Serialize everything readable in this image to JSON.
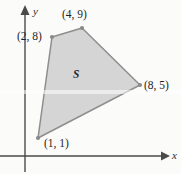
{
  "figure": {
    "background_color": "#fbfbfa",
    "axes": {
      "x_axis_label": "x",
      "y_axis_label": "y",
      "axis_color": "#4a4a4a",
      "x_axis_y_pixel": 156,
      "y_axis_x_pixel": 25
    },
    "region": {
      "label": "S",
      "fill_color": "#d5d5d5",
      "stroke_color": "#8e8e8e",
      "vertex_dot_color": "#8a8a8a",
      "polygon_pixel_points": "52,37 82,28 140,85 38,138"
    },
    "vertex_labels": [
      {
        "key": "v_2_8",
        "text": "(2, 8)"
      },
      {
        "key": "v_4_9",
        "text": "(4, 9)"
      },
      {
        "key": "v_8_5",
        "text": "(8, 5)"
      },
      {
        "key": "v_1_1",
        "text": "(1, 1)"
      }
    ]
  },
  "chart_data": {
    "type": "scatter",
    "title": "",
    "xlabel": "x",
    "ylabel": "y",
    "grid": false,
    "legend": "none",
    "xlim": [
      0,
      10
    ],
    "ylim": [
      0,
      10
    ],
    "annotations": [
      "S"
    ],
    "series": [
      {
        "name": "Region S vertices",
        "shape": "polygon",
        "closed": true,
        "fill": "#d5d5d5",
        "points": [
          {
            "label": "(2, 8)",
            "x": 2,
            "y": 8
          },
          {
            "label": "(4, 9)",
            "x": 4,
            "y": 9
          },
          {
            "label": "(8, 5)",
            "x": 8,
            "y": 5
          },
          {
            "label": "(1, 1)",
            "x": 1,
            "y": 1
          }
        ],
        "x": [
          2,
          4,
          8,
          1
        ],
        "y": [
          8,
          9,
          5,
          1
        ]
      }
    ]
  }
}
